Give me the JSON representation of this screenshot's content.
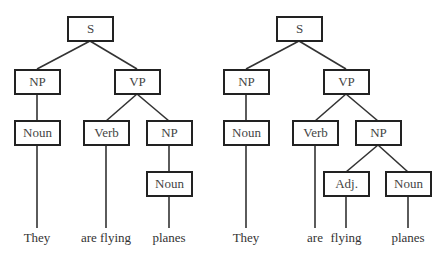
{
  "trees": [
    {
      "name": "left-parse",
      "nodes": {
        "s": "S",
        "np": "NP",
        "vp": "VP",
        "noun1": "Noun",
        "verb": "Verb",
        "np2": "NP",
        "noun2": "Noun"
      },
      "words": [
        "They",
        "are flying",
        "planes"
      ]
    },
    {
      "name": "right-parse",
      "nodes": {
        "s": "S",
        "np": "NP",
        "vp": "VP",
        "noun1": "Noun",
        "verb": "Verb",
        "np2": "NP",
        "adj": "Adj.",
        "noun2": "Noun"
      },
      "words": [
        "They",
        "are",
        "flying",
        "planes"
      ]
    }
  ]
}
